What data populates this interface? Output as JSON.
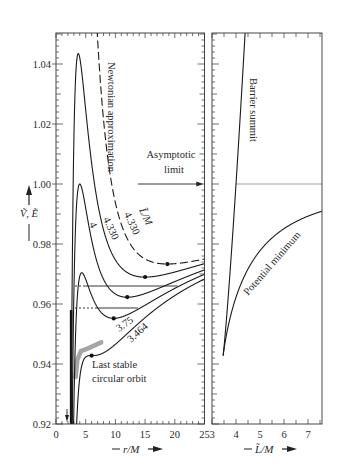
{
  "chart_data": [
    {
      "panel": "left",
      "type": "line",
      "title": "",
      "xlabel": "r/M",
      "ylabel": "Ṽ, Ẽ",
      "xlim": [
        0,
        25
      ],
      "ylim": [
        0.92,
        1.05
      ],
      "grid": false,
      "xticks": [
        0,
        5,
        10,
        15,
        20,
        25
      ],
      "xtick_labels": [
        "0",
        "5",
        "10",
        "15",
        "20",
        "25"
      ],
      "yticks": [
        0.92,
        0.94,
        0.96,
        0.98,
        1.0,
        1.02,
        1.04
      ],
      "ytick_labels": [
        "0.92",
        "0.94",
        "0.96",
        "0.98",
        "1.00",
        "1.02",
        "1.04"
      ],
      "x_sample": [
        3,
        4,
        5,
        6,
        8,
        10,
        15,
        20,
        25
      ],
      "series": [
        {
          "name": "L̃/M = 4.330 (Newtonian approximation)",
          "L": 4.33,
          "model": "newtonian",
          "style": "dashed",
          "values": [
            null,
            null,
            null,
            null,
            1.0215,
            0.9938,
            0.975,
            0.9734,
            0.975
          ]
        },
        {
          "name": "L̃/M = 4.330",
          "L": 4.33,
          "model": "schwarzschild",
          "style": "solid",
          "values": [
            1.0138,
            1.0421,
            1.0247,
            1.0069,
            0.9847,
            0.9747,
            0.969,
            0.9707,
            0.9735
          ]
        },
        {
          "name": "L̃/M = 4",
          "L": 4.0,
          "model": "schwarzschild",
          "style": "solid",
          "values": [
            0.9623,
            1.0,
            0.992,
            0.9813,
            0.9682,
            0.9633,
            0.9635,
            0.9675,
            0.9714
          ]
        },
        {
          "name": "L̃/M = 3.75",
          "L": 3.75,
          "model": "schwarzschild",
          "style": "solid",
          "values": [
            0.9242,
            0.9693,
            0.9682,
            0.9629,
            0.9564,
            0.9553,
            0.9596,
            0.9652,
            0.9699
          ]
        },
        {
          "name": "L̃/M = 3.464",
          "L": 3.464,
          "model": "schwarzschild",
          "style": "solid",
          "values": [
            0.8819,
            0.9354,
            0.9423,
            0.9428,
            0.9437,
            0.9466,
            0.9554,
            0.9628,
            0.9683
          ]
        }
      ],
      "key_points": [
        {
          "label": "peak 4.330",
          "x": 3.75,
          "y": 1.0435
        },
        {
          "label": "peak 4",
          "x": 4.0,
          "y": 1.0
        },
        {
          "label": "peak 3.75",
          "x": 4.34,
          "y": 0.9703
        }
      ],
      "dots": [
        {
          "series": "Newtonian 4.330",
          "x": 18.75,
          "y": 0.9733
        },
        {
          "series": "4.330",
          "x": 15.0,
          "y": 0.969
        },
        {
          "series": "4",
          "x": 12.0,
          "y": 0.9623
        },
        {
          "series": "3.75",
          "x": 9.72,
          "y": 0.9552
        },
        {
          "series": "3.464",
          "x": 6.0,
          "y": 0.9428
        }
      ],
      "gray_levels": [
        {
          "y": 0.966,
          "dotted_from": 3.2,
          "dotted_to": 4.9,
          "solid_to": 20.5
        },
        {
          "y": 0.9587,
          "dotted_from": 3.2,
          "dotted_to": 6.9,
          "solid_to": 13.8
        }
      ],
      "gray_band": [
        [
          3.3,
          0.9357
        ],
        [
          3.6,
          0.9415
        ],
        [
          4.2,
          0.9443
        ],
        [
          5.5,
          0.9453
        ],
        [
          7.6,
          0.9472
        ]
      ],
      "asymptotic_limit": {
        "y": 1.0,
        "arrow_from_x": 13.8,
        "arrow_to_x": 24.8
      },
      "annotations": [
        "Newtonian approximation",
        "Asymptotic limit",
        "L̃/M",
        "4.330",
        "4.330",
        "4",
        "3.75",
        "3.464",
        "Last stable circular orbit"
      ]
    },
    {
      "panel": "right",
      "type": "line",
      "title": "",
      "xlabel": "L̃/M",
      "ylabel": "",
      "xlim": [
        3,
        7.58
      ],
      "ylim": [
        0.92,
        1.05
      ],
      "grid": false,
      "xticks": [
        3,
        4,
        5,
        6,
        7
      ],
      "xtick_labels": [
        "3",
        "4",
        "5",
        "6",
        "7"
      ],
      "x_sample": [
        3.464,
        4.0,
        4.33,
        5.0,
        6.0,
        7.0,
        7.5
      ],
      "series": [
        {
          "name": "Barrier summit",
          "branch": "max",
          "values": [
            0.9428,
            1.0,
            1.0437,
            null,
            null,
            null,
            null
          ]
        },
        {
          "name": "Potential minimum",
          "branch": "min",
          "values": [
            0.9428,
            0.9623,
            0.969,
            0.9765,
            0.9836,
            0.9885,
            0.9902
          ]
        }
      ],
      "asymptotic_limit": {
        "y": 1.0
      },
      "annotations": [
        "Barrier summit",
        "Potential minimum"
      ]
    }
  ],
  "labels": {
    "newtonian": "Newtonian approximation",
    "asymptotic_1": "Asymptotic",
    "asymptotic_2": "limit",
    "l_over_m": "L̃/M",
    "l4330_dashed": "4.330",
    "l4330_solid": "4.330",
    "l4": "4",
    "l375": "3.75",
    "l3464": "3.464",
    "lso_1": "Last stable",
    "lso_2": "circular orbit",
    "barrier": "Barrier summit",
    "potential_min": "Potential minimum",
    "y_axis_title": "Ṽ, Ẽ",
    "x_axis_title_left": "r/M",
    "x_axis_title_right": "L̃/M"
  }
}
